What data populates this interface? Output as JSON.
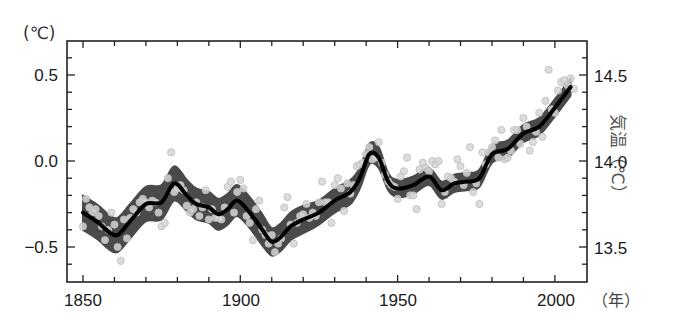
{
  "chart_data": {
    "type": "line",
    "title": "",
    "xlabel": "(年)",
    "ylabel": "(℃)",
    "ylabel_right": "気温（℃）",
    "xlim": [
      1845,
      2010
    ],
    "ylim": [
      -0.7,
      0.7
    ],
    "ylim_right": [
      13.3,
      14.7
    ],
    "grid": false,
    "legend": null,
    "x_ticks": [
      "1850",
      "1900",
      "1950",
      "2000"
    ],
    "y_ticks_left": [
      "0.5",
      "0.0",
      "−0.5"
    ],
    "y_ticks_right": [
      "14.5",
      "14.0",
      "13.5"
    ],
    "series": [
      {
        "name": "smoothed global mean temperature anomaly",
        "style": "thick black line",
        "x": [
          1850,
          1855,
          1858,
          1861,
          1865,
          1870,
          1875,
          1879,
          1883,
          1886,
          1890,
          1893,
          1896,
          1899,
          1903,
          1907,
          1910,
          1913,
          1916,
          1920,
          1925,
          1930,
          1935,
          1938,
          1941,
          1944,
          1947,
          1950,
          1955,
          1960,
          1964,
          1968,
          1972,
          1976,
          1980,
          1985,
          1990,
          1995,
          2000,
          2005
        ],
        "values": [
          -0.3,
          -0.36,
          -0.41,
          -0.43,
          -0.35,
          -0.25,
          -0.24,
          -0.13,
          -0.2,
          -0.25,
          -0.27,
          -0.31,
          -0.28,
          -0.23,
          -0.3,
          -0.4,
          -0.47,
          -0.44,
          -0.38,
          -0.34,
          -0.3,
          -0.23,
          -0.18,
          -0.1,
          0.04,
          0.02,
          -0.12,
          -0.16,
          -0.14,
          -0.09,
          -0.17,
          -0.13,
          -0.12,
          -0.1,
          0.04,
          0.07,
          0.16,
          0.2,
          0.31,
          0.43
        ]
      },
      {
        "name": "uncertainty band",
        "style": "dark gray shaded band",
        "x": [
          1850,
          1855,
          1858,
          1861,
          1865,
          1870,
          1875,
          1879,
          1883,
          1886,
          1890,
          1893,
          1896,
          1899,
          1903,
          1907,
          1910,
          1913,
          1916,
          1920,
          1925,
          1930,
          1935,
          1938,
          1941,
          1944,
          1947,
          1950,
          1955,
          1960,
          1964,
          1968,
          1972,
          1976,
          1980,
          1985,
          1990,
          1995,
          2000,
          2005
        ],
        "half_width": [
          0.1,
          0.1,
          0.1,
          0.1,
          0.1,
          0.1,
          0.1,
          0.1,
          0.09,
          0.09,
          0.09,
          0.09,
          0.09,
          0.09,
          0.09,
          0.09,
          0.08,
          0.08,
          0.08,
          0.08,
          0.07,
          0.07,
          0.07,
          0.06,
          0.06,
          0.06,
          0.05,
          0.05,
          0.05,
          0.05,
          0.05,
          0.05,
          0.05,
          0.05,
          0.05,
          0.05,
          0.05,
          0.05,
          0.05,
          0.05
        ]
      },
      {
        "name": "annual values",
        "style": "light gray circles",
        "points": [
          [
            1850,
            -0.38
          ],
          [
            1851,
            -0.22
          ],
          [
            1852,
            -0.27
          ],
          [
            1853,
            -0.3
          ],
          [
            1854,
            -0.28
          ],
          [
            1855,
            -0.32
          ],
          [
            1856,
            -0.38
          ],
          [
            1857,
            -0.46
          ],
          [
            1858,
            -0.4
          ],
          [
            1859,
            -0.3
          ],
          [
            1860,
            -0.37
          ],
          [
            1861,
            -0.5
          ],
          [
            1862,
            -0.58
          ],
          [
            1863,
            -0.34
          ],
          [
            1864,
            -0.45
          ],
          [
            1865,
            -0.33
          ],
          [
            1866,
            -0.28
          ],
          [
            1867,
            -0.3
          ],
          [
            1868,
            -0.24
          ],
          [
            1869,
            -0.22
          ],
          [
            1870,
            -0.24
          ],
          [
            1871,
            -0.27
          ],
          [
            1872,
            -0.23
          ],
          [
            1873,
            -0.24
          ],
          [
            1874,
            -0.3
          ],
          [
            1875,
            -0.38
          ],
          [
            1876,
            -0.36
          ],
          [
            1877,
            -0.1
          ],
          [
            1878,
            0.05
          ],
          [
            1879,
            -0.18
          ],
          [
            1880,
            -0.16
          ],
          [
            1881,
            -0.14
          ],
          [
            1882,
            -0.17
          ],
          [
            1883,
            -0.26
          ],
          [
            1884,
            -0.3
          ],
          [
            1885,
            -0.28
          ],
          [
            1886,
            -0.24
          ],
          [
            1887,
            -0.32
          ],
          [
            1888,
            -0.27
          ],
          [
            1889,
            -0.17
          ],
          [
            1890,
            -0.34
          ],
          [
            1891,
            -0.28
          ],
          [
            1892,
            -0.33
          ],
          [
            1893,
            -0.33
          ],
          [
            1894,
            -0.34
          ],
          [
            1895,
            -0.27
          ],
          [
            1896,
            -0.15
          ],
          [
            1897,
            -0.12
          ],
          [
            1898,
            -0.3
          ],
          [
            1899,
            -0.18
          ],
          [
            1900,
            -0.11
          ],
          [
            1901,
            -0.16
          ],
          [
            1902,
            -0.32
          ],
          [
            1903,
            -0.36
          ],
          [
            1904,
            -0.46
          ],
          [
            1905,
            -0.28
          ],
          [
            1906,
            -0.23
          ],
          [
            1907,
            -0.4
          ],
          [
            1908,
            -0.43
          ],
          [
            1909,
            -0.48
          ],
          [
            1910,
            -0.43
          ],
          [
            1911,
            -0.53
          ],
          [
            1912,
            -0.48
          ],
          [
            1913,
            -0.45
          ],
          [
            1914,
            -0.27
          ],
          [
            1915,
            -0.21
          ],
          [
            1916,
            -0.37
          ],
          [
            1917,
            -0.48
          ],
          [
            1918,
            -0.36
          ],
          [
            1919,
            -0.32
          ],
          [
            1920,
            -0.31
          ],
          [
            1921,
            -0.25
          ],
          [
            1922,
            -0.33
          ],
          [
            1923,
            -0.3
          ],
          [
            1924,
            -0.32
          ],
          [
            1925,
            -0.24
          ],
          [
            1926,
            -0.12
          ],
          [
            1927,
            -0.24
          ],
          [
            1928,
            -0.24
          ],
          [
            1929,
            -0.36
          ],
          [
            1930,
            -0.14
          ],
          [
            1931,
            -0.1
          ],
          [
            1932,
            -0.16
          ],
          [
            1933,
            -0.29
          ],
          [
            1934,
            -0.13
          ],
          [
            1935,
            -0.19
          ],
          [
            1936,
            -0.14
          ],
          [
            1937,
            -0.03
          ],
          [
            1938,
            -0.02
          ],
          [
            1939,
            -0.01
          ],
          [
            1940,
            0.04
          ],
          [
            1941,
            0.08
          ],
          [
            1942,
            0.01
          ],
          [
            1943,
            0.02
          ],
          [
            1944,
            0.11
          ],
          [
            1945,
            -0.01
          ],
          [
            1946,
            -0.08
          ],
          [
            1947,
            -0.12
          ],
          [
            1948,
            -0.14
          ],
          [
            1949,
            -0.15
          ],
          [
            1950,
            -0.22
          ],
          [
            1951,
            -0.09
          ],
          [
            1952,
            -0.06
          ],
          [
            1953,
            0.02
          ],
          [
            1954,
            -0.2
          ],
          [
            1955,
            -0.2
          ],
          [
            1956,
            -0.28
          ],
          [
            1957,
            -0.05
          ],
          [
            1958,
            -0.01
          ],
          [
            1959,
            -0.04
          ],
          [
            1960,
            -0.06
          ],
          [
            1961,
            0.0
          ],
          [
            1962,
            -0.02
          ],
          [
            1963,
            0.0
          ],
          [
            1964,
            -0.25
          ],
          [
            1965,
            -0.18
          ],
          [
            1966,
            -0.09
          ],
          [
            1967,
            -0.1
          ],
          [
            1968,
            -0.12
          ],
          [
            1969,
            0.01
          ],
          [
            1970,
            -0.03
          ],
          [
            1971,
            -0.14
          ],
          [
            1972,
            -0.07
          ],
          [
            1973,
            0.08
          ],
          [
            1974,
            -0.18
          ],
          [
            1975,
            -0.13
          ],
          [
            1976,
            -0.25
          ],
          [
            1977,
            0.05
          ],
          [
            1978,
            -0.02
          ],
          [
            1979,
            0.05
          ],
          [
            1980,
            0.08
          ],
          [
            1981,
            0.12
          ],
          [
            1982,
            0.02
          ],
          [
            1983,
            0.18
          ],
          [
            1984,
            0.01
          ],
          [
            1985,
            0.02
          ],
          [
            1986,
            0.06
          ],
          [
            1987,
            0.18
          ],
          [
            1988,
            0.18
          ],
          [
            1989,
            0.1
          ],
          [
            1990,
            0.25
          ],
          [
            1991,
            0.2
          ],
          [
            1992,
            0.06
          ],
          [
            1993,
            0.11
          ],
          [
            1994,
            0.17
          ],
          [
            1995,
            0.28
          ],
          [
            1996,
            0.14
          ],
          [
            1997,
            0.35
          ],
          [
            1998,
            0.53
          ],
          [
            1999,
            0.3
          ],
          [
            2000,
            0.28
          ],
          [
            2001,
            0.41
          ],
          [
            2002,
            0.46
          ],
          [
            2003,
            0.47
          ],
          [
            2004,
            0.44
          ],
          [
            2005,
            0.48
          ],
          [
            2006,
            0.42
          ]
        ]
      }
    ],
    "colors": {
      "line": "#000000",
      "band": "#4a4a4a",
      "points_fill": "#d6d6d6",
      "points_stroke": "#bdbdbd",
      "axis": "#222222"
    },
    "annotations": []
  },
  "labels": {
    "ylabel_left": "(℃)",
    "ylabel_right": "気温（℃）",
    "xlabel": "（年）",
    "x_ticks": [
      "1850",
      "1900",
      "1950",
      "2000"
    ],
    "y_ticks_left": [
      "0.5",
      "0.0",
      "−0.5"
    ],
    "y_ticks_right": [
      "14.5",
      "14.0",
      "13.5"
    ]
  }
}
